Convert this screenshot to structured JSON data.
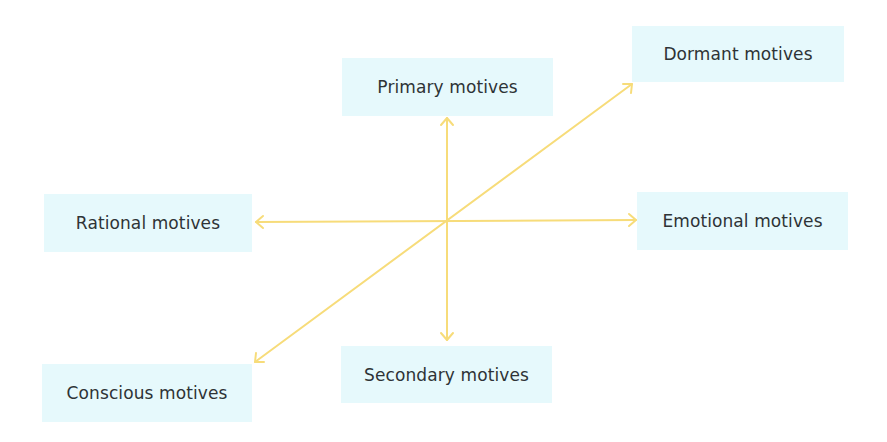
{
  "diagram": {
    "type": "motives-axes",
    "colors": {
      "box_fill": "#e6f9fc",
      "arrow": "#f7dc7a",
      "text": "#2e3336",
      "background": "#ffffff"
    },
    "center": {
      "x": 447,
      "y": 222
    },
    "nodes": {
      "primary": {
        "label": "Primary motives",
        "direction": "up"
      },
      "secondary": {
        "label": "Secondary motives",
        "direction": "down"
      },
      "rational": {
        "label": "Rational motives",
        "direction": "left"
      },
      "emotional": {
        "label": "Emotional motives",
        "direction": "right"
      },
      "dormant": {
        "label": "Dormant motives",
        "direction": "up-right"
      },
      "conscious": {
        "label": "Conscious motives",
        "direction": "down-left"
      }
    },
    "axes": [
      {
        "name": "vertical",
        "from": "secondary",
        "to": "primary"
      },
      {
        "name": "horizontal",
        "from": "rational",
        "to": "emotional"
      },
      {
        "name": "diagonal",
        "from": "conscious",
        "to": "dormant"
      }
    ]
  }
}
